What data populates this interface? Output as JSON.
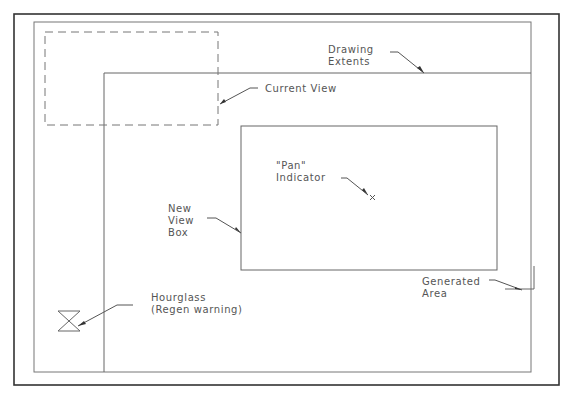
{
  "labels": {
    "drawing_extents": [
      "Drawing",
      "Extents"
    ],
    "current_view": "Current View",
    "pan_indicator": [
      "\"Pan\"",
      "Indicator"
    ],
    "new_view_box": [
      "New",
      "View",
      "Box"
    ],
    "generated_area": [
      "Generated",
      "Area"
    ],
    "hourglass": [
      "Hourglass",
      "(Regen warning)"
    ]
  },
  "colors": {
    "line": "#666666",
    "frame": "#333333",
    "text": "#555555"
  }
}
